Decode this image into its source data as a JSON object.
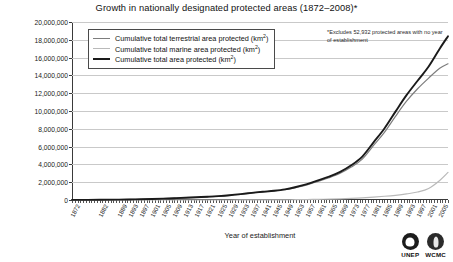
{
  "chart_data": {
    "type": "line",
    "title": "Growth in nationally designated protected areas (1872–2008)*",
    "xlabel": "Year of establishment",
    "ylabel": "Total area protected (km²)",
    "ylim": [
      0,
      20000000
    ],
    "ytick_step": 2000000,
    "ytick_labels": [
      "20,000,000",
      "18,000,000",
      "16,000,000",
      "14,000,000",
      "12,000,000",
      "10,000,000",
      "8,000,000",
      "6,000,000",
      "4,000,000",
      "2,000,000",
      "0"
    ],
    "ytick_values": [
      20000000,
      18000000,
      16000000,
      14000000,
      12000000,
      10000000,
      8000000,
      6000000,
      4000000,
      2000000,
      0
    ],
    "grid": true,
    "legend_position": "upper-left-inside",
    "xlim": [
      1872,
      2008
    ],
    "xtick_labels": [
      "1872",
      "1882",
      "1889",
      "1893",
      "1897",
      "1901",
      "1905",
      "1909",
      "1913",
      "1917",
      "1921",
      "1925",
      "1929",
      "1933",
      "1937",
      "1941",
      "1945",
      "1949",
      "1953",
      "1957",
      "1961",
      "1965",
      "1969",
      "1973",
      "1977",
      "1981",
      "1985",
      "1989",
      "1993",
      "1997",
      "2001",
      "2005"
    ],
    "xtick_values": [
      1872,
      1882,
      1889,
      1893,
      1897,
      1901,
      1905,
      1909,
      1913,
      1917,
      1921,
      1925,
      1929,
      1933,
      1937,
      1941,
      1945,
      1949,
      1953,
      1957,
      1961,
      1965,
      1969,
      1973,
      1977,
      1981,
      1985,
      1989,
      1993,
      1997,
      2001,
      2005
    ],
    "annotation": "*Excludes 52,932 protected areas with no year of establishment",
    "series": [
      {
        "name": "Cumulative total terrestrial area protected (km²)",
        "color": "#7d7d7d",
        "width": 1.2,
        "x": [
          1872,
          1882,
          1889,
          1893,
          1897,
          1901,
          1905,
          1909,
          1913,
          1917,
          1921,
          1925,
          1929,
          1933,
          1937,
          1941,
          1945,
          1949,
          1953,
          1957,
          1961,
          1965,
          1969,
          1973,
          1977,
          1981,
          1985,
          1989,
          1993,
          1997,
          2001,
          2005,
          2008
        ],
        "values": [
          10000,
          25000,
          45000,
          60000,
          80000,
          110000,
          150000,
          200000,
          260000,
          300000,
          360000,
          430000,
          520000,
          640000,
          780000,
          900000,
          1000000,
          1150000,
          1400000,
          1700000,
          2100000,
          2500000,
          3000000,
          3700000,
          4600000,
          6100000,
          7600000,
          9400000,
          11100000,
          12500000,
          13700000,
          14800000,
          15300000
        ]
      },
      {
        "name": "Cumulative total marine area protected (km²)",
        "color": "#b9b9b9",
        "width": 1.2,
        "x": [
          1872,
          1882,
          1889,
          1893,
          1897,
          1901,
          1905,
          1909,
          1913,
          1917,
          1921,
          1925,
          1929,
          1933,
          1937,
          1941,
          1945,
          1949,
          1953,
          1957,
          1961,
          1965,
          1969,
          1973,
          1977,
          1981,
          1985,
          1989,
          1993,
          1997,
          2001,
          2005,
          2008
        ],
        "values": [
          0,
          0,
          0,
          0,
          0,
          0,
          0,
          0,
          0,
          0,
          0,
          0,
          0,
          5000,
          8000,
          12000,
          18000,
          25000,
          35000,
          50000,
          70000,
          95000,
          130000,
          180000,
          250000,
          330000,
          420000,
          530000,
          680000,
          900000,
          1300000,
          2200000,
          3100000
        ]
      },
      {
        "name": "Cumulative total area protected (km²)",
        "color": "#1a1a1a",
        "width": 1.9,
        "x": [
          1872,
          1882,
          1889,
          1893,
          1897,
          1901,
          1905,
          1909,
          1913,
          1917,
          1921,
          1925,
          1929,
          1933,
          1937,
          1941,
          1945,
          1949,
          1953,
          1957,
          1961,
          1965,
          1969,
          1973,
          1977,
          1981,
          1985,
          1989,
          1993,
          1997,
          2001,
          2005,
          2008
        ],
        "values": [
          10000,
          25000,
          45000,
          60000,
          80000,
          110000,
          150000,
          200000,
          260000,
          305000,
          368000,
          440000,
          535000,
          660000,
          805000,
          930000,
          1040000,
          1200000,
          1460000,
          1780000,
          2200000,
          2620000,
          3160000,
          3900000,
          4880000,
          6450000,
          8030000,
          9930000,
          11780000,
          13400000,
          15000000,
          17000000,
          18400000
        ]
      }
    ]
  },
  "legend": {
    "items": [
      {
        "label_main": "Cumulative total terrestrial area protected (km",
        "label_sup": "2",
        "label_end": ")",
        "color": "#7d7d7d",
        "width": "1.2px"
      },
      {
        "label_main": "Cumulative total marine area protected (km",
        "label_sup": "2",
        "label_end": ")",
        "color": "#b9b9b9",
        "width": "1.2px"
      },
      {
        "label_main": "Cumulative total area protected (km",
        "label_sup": "2",
        "label_end": ")",
        "color": "#1a1a1a",
        "width": "2px"
      }
    ]
  },
  "logos": [
    {
      "caption": "UNEP",
      "mark": "globe-leaf-icon"
    },
    {
      "caption": "WCMC",
      "mark": "flame-leaf-icon"
    }
  ]
}
